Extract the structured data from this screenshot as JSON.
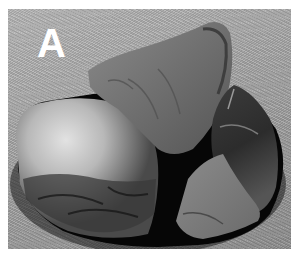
{
  "figure": {
    "panel_label": "A",
    "colors": {
      "background_fabric": "#a8a8a8",
      "stone_light": "#cfcfcf",
      "stone_mid": "#6e6e6e",
      "stone_dark": "#2a2a2a",
      "gap_shadow": "#080808",
      "label": "#ffffff",
      "margin": "#ffffff"
    },
    "objects": [
      {
        "name": "left-stone",
        "shade": "light reflective cortex, dark flaked lower edge"
      },
      {
        "name": "top-stone",
        "shade": "medium gray flake"
      },
      {
        "name": "right-stone",
        "shade": "dark gray flake with lighter lower face"
      }
    ]
  }
}
